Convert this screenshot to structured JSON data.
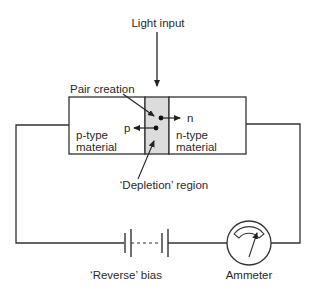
{
  "labels": {
    "light_input": "Light input",
    "pair_creation": "Pair creation",
    "n_carrier": "n",
    "p_carrier": "p",
    "p_type_line1": "p-type",
    "p_type_line2": "material",
    "n_type_line1": "n-type",
    "n_type_line2": "material",
    "depletion_region": "‘Depletion’ region",
    "reverse_bias": "‘Reverse’ bias",
    "ammeter": "Ammeter"
  },
  "colors": {
    "line": "#333333",
    "depletion_fill": "#dcdcdc",
    "background": "#ffffff"
  }
}
